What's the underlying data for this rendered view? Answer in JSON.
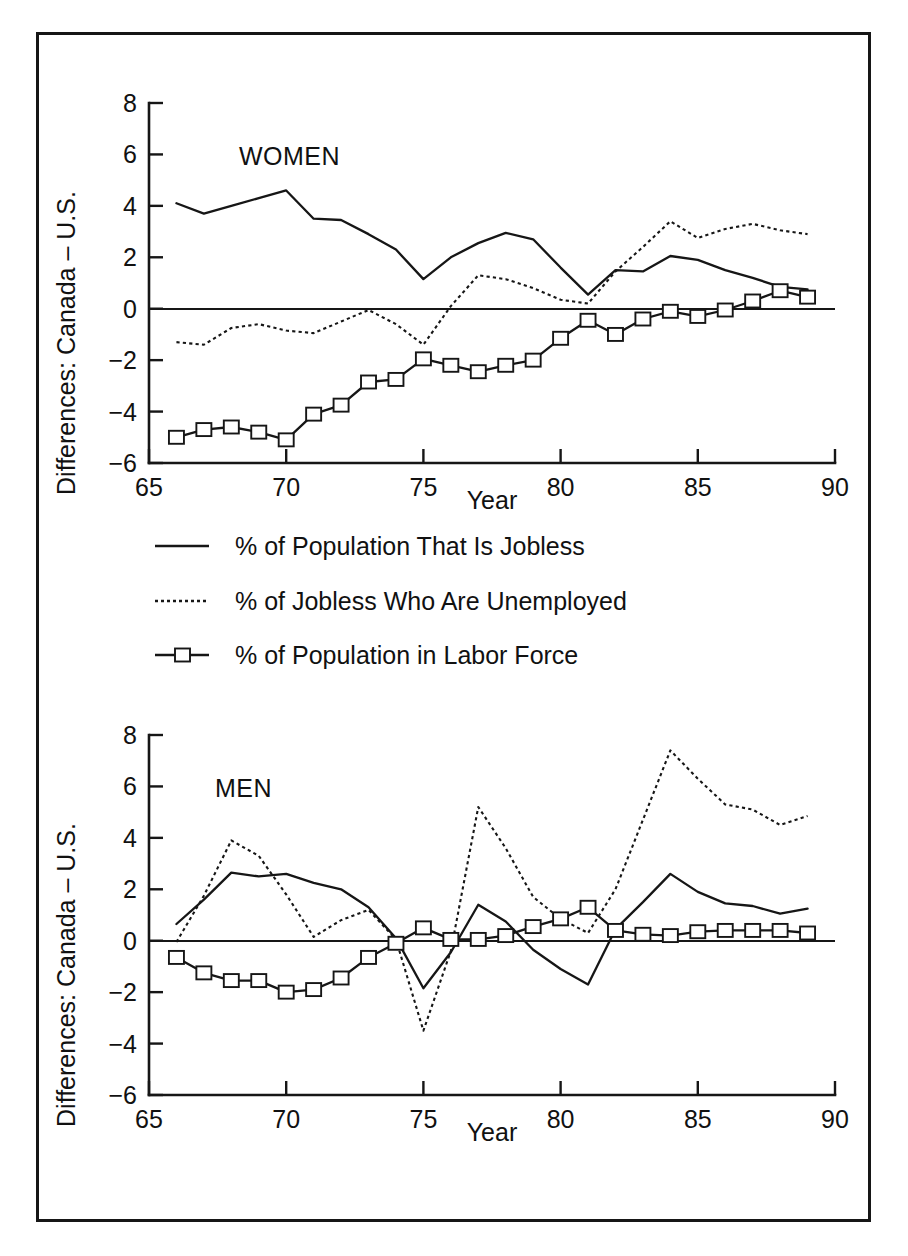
{
  "figure": {
    "y_axis_label": "Differences: Canada – U.S.",
    "x_axis_label": "Year"
  },
  "legend": {
    "items": [
      {
        "marker": "solid-line",
        "label": "% of Population That Is Jobless"
      },
      {
        "marker": "dotted-line",
        "label": "% of Jobless Who Are Unemployed"
      },
      {
        "marker": "square-line",
        "label": "% of Population in Labor Force"
      }
    ]
  },
  "chart_data": [
    {
      "type": "line",
      "title": "WOMEN",
      "panel": "top",
      "xlabel": "Year",
      "ylabel": "Differences: Canada – U.S.",
      "xlim": [
        65,
        90
      ],
      "ylim": [
        -6,
        8
      ],
      "xticks": [
        65,
        70,
        75,
        80,
        85,
        90
      ],
      "yticks": [
        8,
        6,
        4,
        2,
        0,
        -2,
        -4,
        -6
      ],
      "grid": false,
      "legend_position": "below-panel",
      "zero_reference_line": 0,
      "x": [
        66,
        67,
        68,
        69,
        70,
        71,
        72,
        73,
        74,
        75,
        76,
        77,
        78,
        79,
        80,
        81,
        82,
        83,
        84,
        85,
        86,
        87,
        88,
        89
      ],
      "series": [
        {
          "name": "% of Population That Is Jobless",
          "style": "solid",
          "values": [
            4.1,
            3.7,
            4.0,
            4.3,
            4.6,
            3.5,
            3.45,
            2.9,
            2.3,
            1.15,
            2.0,
            2.55,
            2.95,
            2.7,
            1.6,
            0.55,
            1.5,
            1.45,
            2.05,
            1.9,
            1.5,
            1.2,
            0.85,
            0.75
          ]
        },
        {
          "name": "% of Jobless Who Are Unemployed",
          "style": "dotted",
          "values": [
            -1.3,
            -1.4,
            -0.75,
            -0.6,
            -0.85,
            -0.95,
            -0.5,
            -0.05,
            -0.6,
            -1.4,
            0.1,
            1.3,
            1.15,
            0.8,
            0.35,
            0.2,
            1.45,
            2.4,
            3.4,
            2.75,
            3.1,
            3.3,
            3.05,
            2.9
          ]
        },
        {
          "name": "% of Population in Labor Force",
          "style": "square",
          "values": [
            -5.0,
            -4.7,
            -4.6,
            -4.8,
            -5.1,
            -4.1,
            -3.75,
            -2.85,
            -2.75,
            -1.95,
            -2.2,
            -2.45,
            -2.2,
            -2.0,
            -1.15,
            -0.45,
            -1.0,
            -0.4,
            -0.1,
            -0.3,
            -0.05,
            0.3,
            0.7,
            0.45
          ]
        }
      ]
    },
    {
      "type": "line",
      "title": "MEN",
      "panel": "bottom",
      "xlabel": "Year",
      "ylabel": "Differences: Canada – U.S.",
      "xlim": [
        65,
        90
      ],
      "ylim": [
        -6,
        8
      ],
      "xticks": [
        65,
        70,
        75,
        80,
        85,
        90
      ],
      "yticks": [
        8,
        6,
        4,
        2,
        0,
        -2,
        -4,
        -6
      ],
      "grid": false,
      "legend_position": "above-panel",
      "zero_reference_line": 0,
      "x": [
        66,
        67,
        68,
        69,
        70,
        71,
        72,
        73,
        74,
        75,
        76,
        77,
        78,
        79,
        80,
        81,
        82,
        83,
        84,
        85,
        86,
        87,
        88,
        89
      ],
      "series": [
        {
          "name": "% of Population That Is Jobless",
          "style": "solid",
          "values": [
            0.65,
            1.6,
            2.65,
            2.5,
            2.6,
            2.25,
            2.0,
            1.3,
            0.1,
            -1.85,
            -0.45,
            1.4,
            0.75,
            -0.35,
            -1.1,
            -1.7,
            0.45,
            1.5,
            2.6,
            1.9,
            1.45,
            1.35,
            1.05,
            1.25
          ]
        },
        {
          "name": "% of Jobless Who Are Unemployed",
          "style": "dotted",
          "values": [
            -0.05,
            1.75,
            3.9,
            3.3,
            1.8,
            0.15,
            0.8,
            1.2,
            0.05,
            -3.5,
            -0.4,
            5.2,
            3.6,
            1.7,
            0.85,
            0.3,
            2.0,
            4.7,
            7.4,
            6.3,
            5.3,
            5.1,
            4.5,
            4.85
          ]
        },
        {
          "name": "% of Population in Labor Force",
          "style": "square",
          "values": [
            -0.65,
            -1.25,
            -1.55,
            -1.55,
            -2.0,
            -1.9,
            -1.45,
            -0.65,
            -0.1,
            0.5,
            0.05,
            0.05,
            0.2,
            0.55,
            0.85,
            1.3,
            0.4,
            0.25,
            0.2,
            0.35,
            0.4,
            0.4,
            0.4,
            0.3
          ]
        }
      ]
    }
  ]
}
